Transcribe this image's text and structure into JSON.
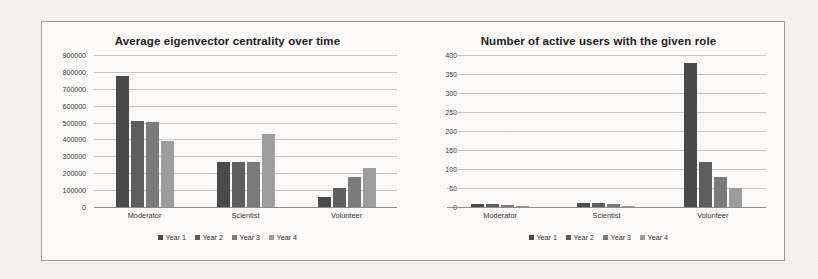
{
  "figure": {
    "background_color": "#f4f3f1",
    "panel_background": "#fcfbfa",
    "border_color": "#9a9a9a",
    "series_colors": [
      "#4a4a4a",
      "#5e5e5e",
      "#7b7b7b",
      "#9e9e9e"
    ]
  },
  "chart_data": [
    {
      "type": "bar",
      "title": "Average eigenvector centrality over time",
      "xlabel": "",
      "ylabel": "",
      "categories": [
        "Moderator",
        "Scientist",
        "Volunteer"
      ],
      "series": [
        {
          "name": "Year 1",
          "values": [
            775000,
            265000,
            60000
          ]
        },
        {
          "name": "Year 2",
          "values": [
            510000,
            265000,
            110000
          ]
        },
        {
          "name": "Year 3",
          "values": [
            505000,
            265000,
            175000
          ]
        },
        {
          "name": "Year 4",
          "values": [
            390000,
            430000,
            230000
          ]
        }
      ],
      "ylim": [
        0,
        900000
      ],
      "yticks": [
        0,
        100000,
        200000,
        300000,
        400000,
        500000,
        600000,
        700000,
        800000,
        900000
      ],
      "ytick_labels": [
        "0",
        "100000",
        "200000",
        "300000",
        "400000",
        "500000",
        "600000",
        "700000",
        "800000",
        "900000"
      ],
      "grid": true,
      "legend_position": "bottom",
      "legend": [
        "Year 1",
        "Year 2",
        "Year 3",
        "Year 4"
      ]
    },
    {
      "type": "bar",
      "title": "Number of active users with the given role",
      "xlabel": "",
      "ylabel": "",
      "categories": [
        "Moderator",
        "Scientist",
        "Volunteer"
      ],
      "series": [
        {
          "name": "Year 1",
          "values": [
            8,
            10,
            378
          ]
        },
        {
          "name": "Year 2",
          "values": [
            8,
            10,
            118
          ]
        },
        {
          "name": "Year 3",
          "values": [
            5,
            7,
            80
          ]
        },
        {
          "name": "Year 4",
          "values": [
            3,
            3,
            50
          ]
        }
      ],
      "ylim": [
        0,
        400
      ],
      "yticks": [
        0,
        50,
        100,
        150,
        200,
        250,
        300,
        350,
        400
      ],
      "ytick_labels": [
        "0",
        "50",
        "100",
        "150",
        "200",
        "250",
        "300",
        "350",
        "400"
      ],
      "grid": true,
      "legend_position": "bottom",
      "legend": [
        "Year 1",
        "Year 2",
        "Year 3",
        "Year 4"
      ]
    }
  ]
}
